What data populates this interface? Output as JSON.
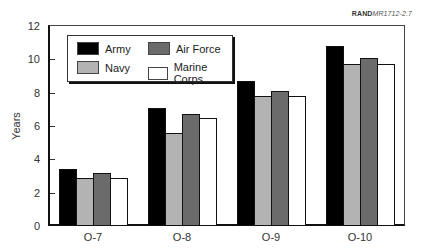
{
  "source_label": {
    "bold": "RAND",
    "italic": "MR1712-2.7"
  },
  "chart_data": {
    "type": "bar",
    "title": "",
    "xlabel": "",
    "ylabel": "Years",
    "ylim": [
      0,
      12
    ],
    "yticks": [
      0,
      2,
      4,
      6,
      8,
      10,
      12
    ],
    "categories": [
      "O-7",
      "O-8",
      "O-9",
      "O-10"
    ],
    "series": [
      {
        "name": "Army",
        "color": "#000000",
        "values": [
          3.4,
          7.1,
          8.7,
          10.8
        ]
      },
      {
        "name": "Navy",
        "color": "#b3b3b3",
        "values": [
          2.9,
          5.6,
          7.8,
          9.7
        ]
      },
      {
        "name": "Air Force",
        "color": "#6b6b6b",
        "values": [
          3.2,
          6.7,
          8.1,
          10.1
        ]
      },
      {
        "name": "Marine Corps",
        "color": "#ffffff",
        "values": [
          2.9,
          6.5,
          7.8,
          9.7
        ]
      }
    ],
    "grid": false,
    "legend_position": "upper-left inside"
  }
}
